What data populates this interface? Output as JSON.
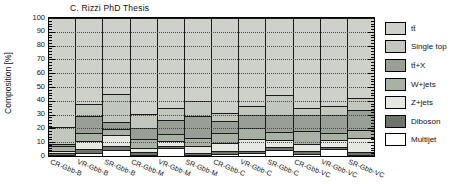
{
  "title": "C. Rizzi PhD Thesis",
  "chart_data": {
    "type": "bar",
    "stacked": true,
    "orientation": "vertical",
    "title": "C. Rizzi PhD Thesis",
    "xlabel": "",
    "ylabel": "Composition [%]",
    "ylim": [
      0,
      100
    ],
    "yticks": [
      0,
      10,
      20,
      30,
      40,
      50,
      60,
      70,
      80,
      90,
      100
    ],
    "grid": "horizontal dotted lines at each 10%",
    "legend_position": "right of plot, outside",
    "plot_background": "#cdd1ca",
    "categories": [
      "CR-Gbb-B",
      "VR-Gbb-B",
      "SR-Gbb-B",
      "CR-Gbb-M",
      "VR-Gbb-M",
      "SR-Gbb-M",
      "CR-Gbb-C",
      "VR-Gbb-C",
      "SR-Gbb-C",
      "CR-Gbb-VC",
      "VR-Gbb-VC",
      "SR-Gbb-VC"
    ],
    "stack_order_note": "series listed bottom-to-top of stack; values are percent of composition",
    "series": [
      {
        "name": "Multijet",
        "color": "#ffffff",
        "values": [
          1.0,
          2.0,
          4.5,
          0.5,
          6.0,
          1.0,
          1.5,
          2.0,
          4.5,
          1.5,
          5.0,
          0.5
        ]
      },
      {
        "name": "Diboson",
        "color": "#6d746a",
        "values": [
          1.5,
          3.0,
          2.5,
          2.5,
          1.0,
          1.0,
          2.0,
          2.0,
          1.7,
          2.5,
          1.5,
          2.5
        ]
      },
      {
        "name": "Z+jets",
        "color": "#e5e8e1",
        "values": [
          1.5,
          6.0,
          8.0,
          2.5,
          4.0,
          5.0,
          6.0,
          8.0,
          5.3,
          4.5,
          5.0,
          10.0
        ]
      },
      {
        "name": "W+jets",
        "color": "#a9b1a5",
        "values": [
          3.0,
          6.0,
          4.5,
          6.5,
          5.0,
          6.0,
          7.5,
          8.5,
          5.8,
          10.0,
          5.5,
          6.0
        ]
      },
      {
        "name": "tt̄+X",
        "color": "#98a095",
        "values": [
          2.0,
          12.0,
          5.5,
          8.0,
          10.0,
          16.0,
          8.5,
          9.5,
          12.7,
          11.5,
          13.0,
          14.0
        ]
      },
      {
        "name": "Single top",
        "color": "#c1c7bc",
        "values": [
          12.0,
          9.0,
          20.0,
          10.0,
          9.0,
          11.0,
          6.0,
          6.5,
          14.0,
          5.0,
          6.0,
          9.0
        ]
      },
      {
        "name": "tt̄",
        "color": "#cdd1ca",
        "values": [
          79.0,
          62.0,
          55.0,
          70.0,
          65.0,
          60.0,
          68.5,
          63.5,
          56.0,
          65.0,
          64.0,
          58.0
        ]
      }
    ],
    "legend_entries_top_to_bottom": [
      "tt̄",
      "Single top",
      "tt̄+X",
      "W+jets",
      "Z+jets",
      "Diboson",
      "Multijet"
    ]
  }
}
